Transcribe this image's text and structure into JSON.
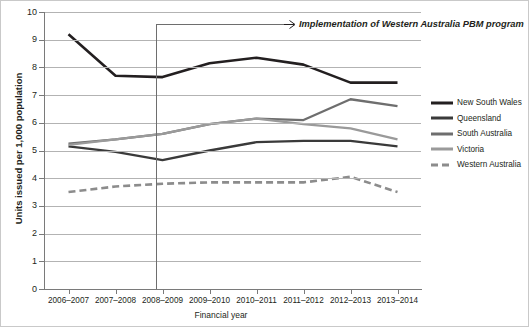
{
  "chart_data": {
    "type": "line",
    "title": "",
    "xlabel": "Financial year",
    "ylabel": "Units issued per 1,000 population",
    "categories": [
      "2006–2007",
      "2007–2008",
      "2008–2009",
      "2009–2010",
      "2010–2011",
      "2011–2012",
      "2012–2013",
      "2013–2014"
    ],
    "ylim": [
      0,
      10
    ],
    "yticks": [
      "0",
      "1",
      "2",
      "3",
      "4",
      "5",
      "6",
      "7",
      "8",
      "9",
      "10"
    ],
    "grid": true,
    "legend_position": "right",
    "series": [
      {
        "name": "New South Wales",
        "color": "#231f20",
        "style": "solid",
        "width": 2.6,
        "values": [
          9.2,
          7.7,
          7.65,
          8.15,
          8.35,
          8.1,
          7.45,
          7.45
        ]
      },
      {
        "name": "Queensland",
        "color": "#3a3a3a",
        "style": "solid",
        "width": 2.3,
        "values": [
          5.15,
          4.95,
          4.65,
          5.0,
          5.3,
          5.35,
          5.35,
          5.15
        ]
      },
      {
        "name": "South Australia",
        "color": "#6e6e6e",
        "style": "solid",
        "width": 2.3,
        "values": [
          5.25,
          5.4,
          5.6,
          5.95,
          6.15,
          6.1,
          6.85,
          6.6
        ]
      },
      {
        "name": "Victoria",
        "color": "#9a9a9a",
        "style": "solid",
        "width": 2.3,
        "values": [
          5.2,
          5.4,
          5.6,
          5.95,
          6.15,
          5.95,
          5.8,
          5.4
        ]
      },
      {
        "name": "Western Australia",
        "color": "#8c8c8c",
        "style": "dashed",
        "width": 2.6,
        "values": [
          3.5,
          3.7,
          3.8,
          3.85,
          3.85,
          3.85,
          4.05,
          3.5
        ]
      }
    ],
    "annotations": [
      {
        "text": "Implementation of Western Australia PBM program",
        "at_category": "2008–2009",
        "marker": "vertical-line-with-arrow"
      }
    ]
  },
  "legend": {
    "items": [
      {
        "label": "New South Wales"
      },
      {
        "label": "Queensland"
      },
      {
        "label": "South Australia"
      },
      {
        "label": "Victoria"
      },
      {
        "label": "Western Australia"
      }
    ]
  }
}
